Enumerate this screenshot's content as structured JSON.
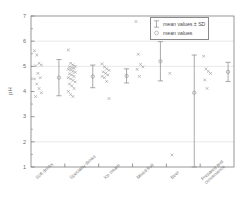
{
  "chart_data": {
    "type": "scatter",
    "title": "",
    "xlabel": "",
    "ylabel": "pH",
    "ylim": [
      1,
      7
    ],
    "yticks": [
      "1",
      "2",
      "3",
      "4",
      "5",
      "6",
      "7"
    ],
    "ytick_values": [
      1,
      2,
      3,
      4,
      5,
      6,
      7
    ],
    "minor_ticks": true,
    "gridlines": [
      2,
      5,
      6
    ],
    "grid": true,
    "legend_position": "top-right",
    "legend": [
      {
        "key": "errorbar",
        "label": "mean values ± SD"
      },
      {
        "key": "circle",
        "label": "mean values"
      }
    ],
    "categories": [
      "Soft drinks",
      "Speciality drinks",
      "Ice cream",
      "Mixed fruit",
      "Beer",
      "Prepared and\nconvenience"
    ],
    "series": [
      {
        "name": "Soft drinks",
        "mean": 4.55,
        "sd": 0.72,
        "sd_low": 3.83,
        "sd_high": 5.27,
        "points": [
          5.62,
          5.45,
          5.12,
          5.05,
          5.02,
          4.72,
          4.55,
          4.5,
          4.3,
          4.12,
          3.95,
          3.8
        ]
      },
      {
        "name": "Speciality drinks",
        "mean": 4.6,
        "sd": 0.45,
        "sd_low": 4.15,
        "sd_high": 5.05,
        "points": [
          5.65,
          5.12,
          5.06,
          5.0,
          4.98,
          4.95,
          4.92,
          4.88,
          4.85,
          4.8,
          4.76,
          4.7,
          4.66,
          4.6,
          4.55,
          4.5,
          4.44,
          4.38,
          4.3,
          4.22,
          4.12,
          4.0,
          3.88,
          3.8
        ]
      },
      {
        "name": "Ice cream",
        "mean": 4.62,
        "sd": 0.28,
        "sd_low": 4.34,
        "sd_high": 4.9,
        "points": [
          5.1,
          4.98,
          4.9,
          4.84,
          4.78,
          4.72,
          4.66,
          4.6,
          4.55,
          4.4,
          3.72
        ]
      },
      {
        "name": "Mixed fruit",
        "mean": 5.2,
        "sd": 0.78,
        "sd_low": 4.42,
        "sd_high": 5.98,
        "points": [
          6.78,
          5.48,
          5.08,
          4.98,
          4.88,
          4.6
        ]
      },
      {
        "name": "Beer",
        "mean": 3.95,
        "sd": 2.25,
        "sd_low": 1.0,
        "sd_high": 5.45,
        "points": [
          4.72,
          1.48
        ]
      },
      {
        "name": "Prepared and convenience",
        "mean": 4.78,
        "sd": 0.38,
        "sd_low": 4.4,
        "sd_high": 5.16,
        "points": [
          5.4,
          4.9,
          4.8,
          4.72,
          4.46,
          4.12
        ]
      }
    ],
    "colors": {
      "point": "#9a9a9a",
      "errorbar": "#8c8c8c",
      "mean_marker": "#9a9a9a",
      "axis": "#7d7d7d",
      "grid": "#d8d8d8",
      "text": "#6b6b6b"
    }
  }
}
